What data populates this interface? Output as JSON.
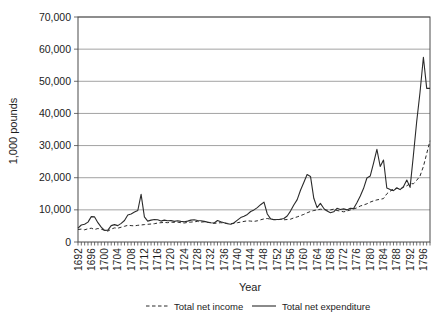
{
  "chart_data": {
    "type": "line",
    "title": "",
    "xlabel": "Year",
    "ylabel": "1,000 pounds",
    "x_start": 1692,
    "x_end": 1798,
    "x_tick_interval": 4,
    "ylim": [
      0,
      70000
    ],
    "y_tick_interval": 10000,
    "grid": "horizontal",
    "legend_position": "bottom",
    "x_tick_labels": [
      1692,
      1696,
      1700,
      1704,
      1708,
      1712,
      1716,
      1720,
      1724,
      1728,
      1732,
      1736,
      1740,
      1744,
      1748,
      1752,
      1756,
      1760,
      1764,
      1768,
      1772,
      1776,
      1780,
      1784,
      1788,
      1792,
      1796
    ],
    "y_tick_labels": [
      "0",
      "10,000",
      "20,000",
      "30,000",
      "40,000",
      "50,000",
      "60,000",
      "70,000"
    ],
    "series": [
      {
        "name": "Total net income",
        "style": "dashed",
        "values": [
          3900,
          4000,
          3800,
          4100,
          4300,
          3900,
          4200,
          4000,
          3600,
          3400,
          4000,
          4400,
          4300,
          4600,
          4900,
          5200,
          5100,
          5000,
          5200,
          5300,
          5400,
          5500,
          5600,
          5700,
          5900,
          6000,
          6100,
          6000,
          6200,
          6100,
          6200,
          6000,
          5900,
          6100,
          6200,
          6300,
          6400,
          6200,
          6300,
          6100,
          6000,
          5800,
          5900,
          6000,
          5900,
          5800,
          5700,
          5800,
          6000,
          6200,
          6400,
          6600,
          6500,
          6400,
          6600,
          6900,
          7200,
          7300,
          7100,
          7000,
          6900,
          7100,
          6900,
          7000,
          7100,
          7500,
          7800,
          8200,
          8600,
          9100,
          9500,
          9800,
          10000,
          10200,
          10100,
          9900,
          10000,
          10200,
          9800,
          9600,
          9400,
          9600,
          10000,
          10300,
          10600,
          11200,
          11500,
          11900,
          12400,
          12800,
          13100,
          13300,
          13500,
          15000,
          15800,
          16500,
          16800,
          16500,
          17000,
          17500,
          18200,
          18100,
          19200,
          20500,
          23500,
          27500,
          31500
        ]
      },
      {
        "name": "Total net expenditure",
        "style": "solid",
        "values": [
          4300,
          5300,
          5500,
          6200,
          7900,
          7800,
          6000,
          4600,
          3600,
          3700,
          5100,
          5400,
          5100,
          5800,
          6700,
          8400,
          8700,
          9300,
          9800,
          14800,
          7800,
          6500,
          6800,
          7000,
          6900,
          6500,
          6800,
          6600,
          6700,
          6400,
          6600,
          6400,
          6300,
          6500,
          6800,
          6900,
          6700,
          6600,
          6400,
          6200,
          6000,
          5900,
          6700,
          6300,
          6000,
          5700,
          5500,
          6000,
          6800,
          7600,
          8000,
          8600,
          9500,
          10000,
          10700,
          11600,
          12400,
          8700,
          7200,
          6900,
          7000,
          7100,
          7300,
          8100,
          9600,
          11500,
          13200,
          16100,
          18500,
          21000,
          20400,
          13600,
          10700,
          12000,
          10500,
          9600,
          9100,
          9400,
          10500,
          10100,
          10300,
          10000,
          10500,
          10400,
          12200,
          14300,
          16700,
          19900,
          20500,
          24500,
          28800,
          23500,
          25500,
          16800,
          16300,
          16000,
          16800,
          16300,
          17200,
          19300,
          17000,
          27000,
          37500,
          46500,
          57500,
          47800,
          47800
        ]
      }
    ]
  }
}
